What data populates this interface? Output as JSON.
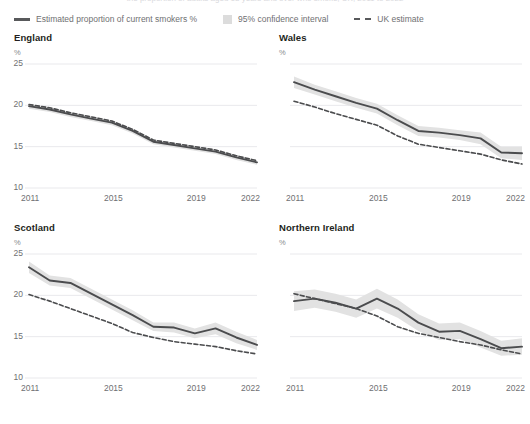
{
  "clipped_header": "the proportion of adults aged 18 years and over who smoke, UK, 2011 to 2022",
  "legend": {
    "items": [
      {
        "label": "Estimated proportion of current smokers %",
        "marker": "solid-line-swatch",
        "color": "#58595b"
      },
      {
        "label": "95% confidence interval",
        "marker": "band-swatch",
        "color": "#dcdcdc"
      },
      {
        "label": "UK estimate",
        "marker": "dashed-line-swatch",
        "color": "#58595b"
      }
    ]
  },
  "chart_data": [
    {
      "type": "line",
      "title": "England",
      "ylabel": "%",
      "xlabel": "",
      "ylim": [
        10,
        25
      ],
      "xlim": [
        2011,
        2022
      ],
      "grid": true,
      "legend_position": "top",
      "yticks": [
        10,
        15,
        20,
        25
      ],
      "ytick_labels": [
        "10",
        "15",
        "20",
        "25"
      ],
      "xticks": [
        2011,
        2015,
        2019,
        2022
      ],
      "xtick_labels": [
        "2011",
        "2015",
        "2019",
        "2022"
      ],
      "x": [
        2011,
        2012,
        2013,
        2014,
        2015,
        2016,
        2017,
        2018,
        2019,
        2020,
        2021,
        2022
      ],
      "series": [
        {
          "name": "Estimated proportion of current smokers %",
          "style": "solid",
          "values": [
            19.9,
            19.5,
            18.9,
            18.4,
            17.9,
            16.9,
            15.6,
            15.2,
            14.8,
            14.4,
            13.7,
            13.1
          ]
        },
        {
          "name": "UK estimate",
          "style": "dashed",
          "values": [
            20.1,
            19.7,
            19.1,
            18.6,
            18.1,
            17.1,
            15.8,
            15.4,
            15.0,
            14.6,
            13.9,
            13.3
          ]
        },
        {
          "name": "95% confidence interval lower",
          "style": "band-lower",
          "values": [
            19.6,
            19.2,
            18.6,
            18.1,
            17.6,
            16.6,
            15.3,
            14.9,
            14.5,
            14.1,
            13.4,
            12.8
          ]
        },
        {
          "name": "95% confidence interval upper",
          "style": "band-upper",
          "values": [
            20.2,
            19.8,
            19.2,
            18.7,
            18.2,
            17.2,
            15.9,
            15.5,
            15.1,
            14.7,
            14.0,
            13.4
          ]
        }
      ]
    },
    {
      "type": "line",
      "title": "Wales",
      "ylabel": "%",
      "xlabel": "",
      "ylim": [
        10,
        25
      ],
      "xlim": [
        2011,
        2022
      ],
      "grid": true,
      "legend_position": "top",
      "yticks": [
        10,
        15,
        20,
        25
      ],
      "ytick_labels": [
        "",
        "",
        "",
        ""
      ],
      "xticks": [
        2011,
        2015,
        2019,
        2022
      ],
      "xtick_labels": [
        "2011",
        "2015",
        "2019",
        "2022"
      ],
      "x": [
        2011,
        2012,
        2013,
        2014,
        2015,
        2016,
        2017,
        2018,
        2019,
        2020,
        2021,
        2022
      ],
      "series": [
        {
          "name": "Estimated proportion of current smokers %",
          "style": "solid",
          "values": [
            22.8,
            21.9,
            21.1,
            20.3,
            19.6,
            18.2,
            16.9,
            16.7,
            16.4,
            16.0,
            14.3,
            14.2
          ]
        },
        {
          "name": "UK estimate",
          "style": "dashed",
          "values": [
            20.5,
            19.8,
            19.0,
            18.3,
            17.6,
            16.3,
            15.3,
            14.9,
            14.5,
            14.1,
            13.4,
            12.9
          ]
        },
        {
          "name": "95% confidence interval lower",
          "style": "band-lower",
          "values": [
            22.1,
            21.3,
            20.5,
            19.7,
            19.0,
            17.6,
            16.3,
            16.1,
            15.8,
            15.3,
            13.6,
            13.4
          ]
        },
        {
          "name": "95% confidence interval upper",
          "style": "band-upper",
          "values": [
            23.5,
            22.5,
            21.7,
            20.9,
            20.2,
            18.8,
            17.5,
            17.3,
            17.0,
            16.7,
            15.0,
            15.0
          ]
        }
      ]
    },
    {
      "type": "line",
      "title": "Scotland",
      "ylabel": "%",
      "xlabel": "",
      "ylim": [
        10,
        25
      ],
      "xlim": [
        2011,
        2022
      ],
      "grid": true,
      "legend_position": "top",
      "yticks": [
        10,
        15,
        20,
        25
      ],
      "ytick_labels": [
        "10",
        "15",
        "20",
        "25"
      ],
      "xticks": [
        2011,
        2015,
        2019,
        2022
      ],
      "xtick_labels": [
        "2011",
        "2015",
        "2019",
        "2022"
      ],
      "x": [
        2011,
        2012,
        2013,
        2014,
        2015,
        2016,
        2017,
        2018,
        2019,
        2020,
        2021,
        2022
      ],
      "series": [
        {
          "name": "Estimated proportion of current smokers %",
          "style": "solid",
          "values": [
            23.4,
            21.8,
            21.5,
            20.2,
            18.9,
            17.6,
            16.2,
            16.1,
            15.4,
            16.0,
            14.9,
            14.0
          ]
        },
        {
          "name": "UK estimate",
          "style": "dashed",
          "values": [
            20.1,
            19.3,
            18.4,
            17.5,
            16.6,
            15.5,
            14.9,
            14.4,
            14.1,
            13.8,
            13.3,
            12.9
          ]
        },
        {
          "name": "95% confidence interval lower",
          "style": "band-lower",
          "values": [
            22.7,
            21.2,
            20.9,
            19.6,
            18.3,
            17.0,
            15.7,
            15.5,
            14.8,
            15.3,
            14.2,
            13.4
          ]
        },
        {
          "name": "95% confidence interval upper",
          "style": "band-upper",
          "values": [
            24.1,
            22.4,
            22.1,
            20.8,
            19.5,
            18.2,
            16.7,
            16.7,
            16.0,
            16.7,
            15.6,
            14.6
          ]
        }
      ]
    },
    {
      "type": "line",
      "title": "Northern Ireland",
      "ylabel": "%",
      "xlabel": "",
      "ylim": [
        10,
        25
      ],
      "xlim": [
        2011,
        2022
      ],
      "grid": true,
      "legend_position": "top",
      "yticks": [
        10,
        15,
        20,
        25
      ],
      "ytick_labels": [
        "",
        "",
        "",
        ""
      ],
      "xticks": [
        2011,
        2015,
        2019,
        2022
      ],
      "xtick_labels": [
        "2011",
        "2015",
        "2019",
        "2022"
      ],
      "x": [
        2011,
        2012,
        2013,
        2014,
        2015,
        2016,
        2017,
        2018,
        2019,
        2020,
        2021,
        2022
      ],
      "series": [
        {
          "name": "Estimated proportion of current smokers %",
          "style": "solid",
          "values": [
            19.3,
            19.6,
            19.1,
            18.4,
            19.6,
            18.4,
            16.7,
            15.6,
            15.7,
            14.7,
            13.6,
            13.8
          ]
        },
        {
          "name": "UK estimate",
          "style": "dashed",
          "values": [
            20.2,
            19.6,
            19.0,
            18.4,
            17.5,
            16.2,
            15.4,
            14.9,
            14.4,
            14.0,
            13.4,
            12.9
          ]
        },
        {
          "name": "95% confidence interval lower",
          "style": "band-lower",
          "values": [
            18.1,
            18.5,
            18.0,
            17.3,
            18.4,
            17.3,
            15.7,
            14.6,
            14.7,
            13.7,
            12.7,
            12.8
          ]
        },
        {
          "name": "95% confidence interval upper",
          "style": "band-upper",
          "values": [
            20.5,
            20.7,
            20.2,
            19.5,
            20.8,
            19.5,
            17.7,
            16.6,
            16.7,
            15.7,
            14.5,
            14.8
          ]
        }
      ]
    }
  ]
}
